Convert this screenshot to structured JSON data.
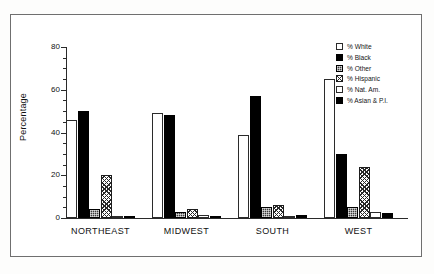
{
  "figure": {
    "axis_title": "Percentage"
  },
  "chart_data": {
    "type": "bar",
    "title": "",
    "subtitle": "",
    "xlabel": "",
    "ylabel": "Percentage",
    "ylim": [
      0,
      80
    ],
    "yticks": [
      0,
      20,
      40,
      60,
      80
    ],
    "ytick_labels": [
      "0",
      "20",
      "40",
      "60",
      "80"
    ],
    "minor_ticks": true,
    "grid": false,
    "legend_position": "upper right",
    "categories": [
      "NORTHEAST",
      "MIDWEST",
      "SOUTH",
      "WEST"
    ],
    "series": [
      {
        "name": "% White",
        "swatch": "outline",
        "values": [
          46,
          49,
          39,
          65
        ]
      },
      {
        "name": "% Black",
        "swatch": "solid-black",
        "values": [
          50,
          48,
          57,
          30
        ]
      },
      {
        "name": "% Other",
        "swatch": "stipple",
        "values": [
          4,
          3,
          5,
          5
        ]
      },
      {
        "name": "% Hispanic",
        "swatch": "crosshatch",
        "values": [
          20,
          4,
          6,
          24
        ]
      },
      {
        "name": "% Nat. Am.",
        "swatch": "outline",
        "values": [
          0.5,
          1.5,
          0.5,
          3
        ]
      },
      {
        "name": "% Asian & P.I.",
        "swatch": "solid-black",
        "values": [
          0.5,
          0.5,
          1.5,
          2.5
        ]
      }
    ]
  },
  "legend": {
    "items": [
      {
        "label": "% White"
      },
      {
        "label": "% Black"
      },
      {
        "label": "% Other"
      },
      {
        "label": "% Hispanic"
      },
      {
        "label": "% Nat. Am."
      },
      {
        "label": "% Asian & P.I."
      }
    ]
  },
  "colors": {
    "ink": "#000000",
    "axis": "#2a2a2a",
    "frame": "#6f6f6f",
    "background": "#ffffff"
  }
}
